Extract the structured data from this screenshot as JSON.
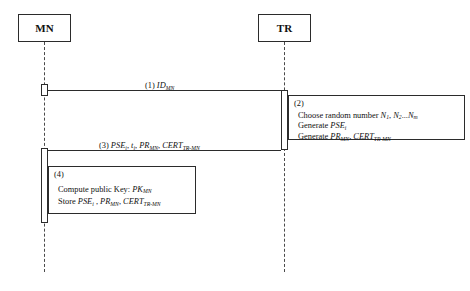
{
  "diagram": {
    "type": "uml-sequence-diagram",
    "participants": [
      {
        "id": "mn",
        "label": "MN"
      },
      {
        "id": "tr",
        "label": "TR"
      }
    ],
    "messages": [
      {
        "number": "(1)",
        "from": "mn",
        "to": "tr",
        "label_plain": "(1) ID_MN",
        "parts": [
          {
            "text": "(1) ",
            "style": "roman"
          },
          {
            "text": "ID",
            "style": "italic"
          },
          {
            "text": "MN",
            "style": "subscript"
          }
        ]
      },
      {
        "number": "(3)",
        "from": "tr",
        "to": "mn",
        "label_plain": "(3) PSE_i, t_i, PR_MN, CERT_TR-MN",
        "parts": [
          {
            "text": "(3) ",
            "style": "roman"
          },
          {
            "text": "PSE",
            "style": "italic"
          },
          {
            "text": "i",
            "style": "subscript"
          },
          {
            "text": ", ",
            "style": "roman"
          },
          {
            "text": "t",
            "style": "italic"
          },
          {
            "text": "i",
            "style": "subscript"
          },
          {
            "text": ", ",
            "style": "roman"
          },
          {
            "text": "PR",
            "style": "italic"
          },
          {
            "text": "MN",
            "style": "subscript"
          },
          {
            "text": ", ",
            "style": "roman"
          },
          {
            "text": "CERT",
            "style": "italic"
          },
          {
            "text": "TR-MN",
            "style": "subscript"
          }
        ]
      }
    ],
    "notes": [
      {
        "number": "(2)",
        "attached_to": "tr",
        "lines": [
          "Choose random number N1, N2...Nm",
          "Generate PSEi",
          "Generate PRMN, CERTTR-MN"
        ]
      },
      {
        "number": "(4)",
        "attached_to": "mn",
        "lines": [
          "Compute public Key: PKMN",
          "Store PSEi , PRMN, CERTTR-MN"
        ]
      }
    ]
  },
  "participants": {
    "mn": {
      "label": "MN"
    },
    "tr": {
      "label": "TR"
    }
  },
  "messages": {
    "m1": {
      "number": "(1)",
      "symbol": "ID",
      "subscript": "MN"
    },
    "m3": {
      "number": "(3)",
      "s1": "PSE",
      "sub1": "i",
      "s2": "t",
      "sub2": "i",
      "s3": "PR",
      "sub3": "MN",
      "s4": "CERT",
      "sub4": "TR-MN",
      "sep": ", "
    }
  },
  "note2": {
    "tag": "(2)",
    "line1_a": "Choose random number ",
    "line1_n1": "N",
    "line1_n1sub": "1",
    "line1_n2": "N",
    "line1_n2sub": "2",
    "line1_ellipsis": "...",
    "line1_n3": "N",
    "line1_n3sub": "m",
    "line1_sep": ", ",
    "line2_a": "Generate ",
    "line2_sym": "PSE",
    "line2_sub": "i",
    "line3_a": "Generate ",
    "line3_s1": "PR",
    "line3_sub1": "MN",
    "line3_s2": "CERT",
    "line3_sub2": "TR-MN",
    "line3_sep": ", "
  },
  "note4": {
    "tag": "(4)",
    "line1_a": "Compute public Key: ",
    "line1_sym": "PK",
    "line1_sub": "MN",
    "line2_a": "Store ",
    "line2_s1": "PSE",
    "line2_sub1": "i",
    "line2_s2": "PR",
    "line2_sub2": "MN",
    "line2_s3": "CERT",
    "line2_sub3": "TR-MN",
    "line2_sep1": " , ",
    "line2_sep2": ", "
  },
  "colors": {
    "stroke": "#2b2b2b",
    "lifeline": "#4a4a4a",
    "text": "#111111",
    "background": "#ffffff"
  }
}
